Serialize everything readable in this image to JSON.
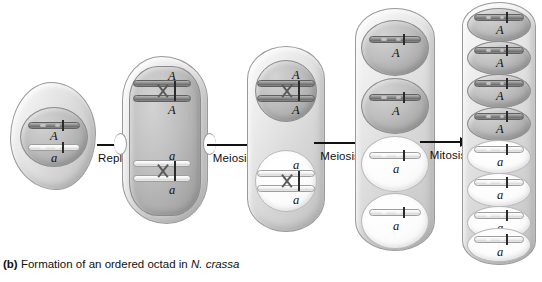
{
  "figure": {
    "caption_tag": "(b)",
    "caption_text": "Formation of an ordered octad in",
    "caption_species": "N. crassa",
    "background_color": "#ffffff",
    "allele_dominant": "A",
    "allele_recessive": "a"
  },
  "arrows": [
    {
      "label": "Replication"
    },
    {
      "label": "Meiosis I"
    },
    {
      "label": "Meiosis II"
    },
    {
      "label": "Mitosis"
    }
  ],
  "stages": [
    {
      "name": "parent-cell",
      "nuclei": [
        {
          "shade": "dark",
          "chromosomes": [
            {
              "allele": "A",
              "shade": "dark"
            },
            {
              "allele": "a",
              "shade": "light"
            }
          ]
        }
      ]
    },
    {
      "name": "replicated-cell",
      "nuclei": [
        {
          "shade": "dark",
          "chromosomes": [
            {
              "allele_top": "A",
              "allele_bottom": "A",
              "shade": "dark",
              "replicated": true
            },
            {
              "allele_top": "a",
              "allele_bottom": "a",
              "shade": "light",
              "replicated": true
            }
          ]
        }
      ]
    },
    {
      "name": "meiosis-one-cell",
      "nuclei": [
        {
          "shade": "dark",
          "allele_top": "A",
          "allele_bottom": "A"
        },
        {
          "shade": "light",
          "allele_top": "a",
          "allele_bottom": "a"
        }
      ]
    },
    {
      "name": "meiosis-two-cell",
      "nuclei": [
        {
          "shade": "dark",
          "allele": "A"
        },
        {
          "shade": "dark",
          "allele": "A"
        },
        {
          "shade": "light",
          "allele": "a"
        },
        {
          "shade": "light",
          "allele": "a"
        }
      ]
    },
    {
      "name": "octad-cell",
      "nuclei": [
        {
          "shade": "dark",
          "allele": "A"
        },
        {
          "shade": "dark",
          "allele": "A"
        },
        {
          "shade": "dark",
          "allele": "A"
        },
        {
          "shade": "dark",
          "allele": "A"
        },
        {
          "shade": "light",
          "allele": "a"
        },
        {
          "shade": "light",
          "allele": "a"
        },
        {
          "shade": "light",
          "allele": "a"
        },
        {
          "shade": "light",
          "allele": "a"
        }
      ]
    }
  ],
  "colors": {
    "cell_outline": "#9a9a9a",
    "nucleus_dark": "#a6a6a6",
    "nucleus_light": "#fcfcfc",
    "chromosome_dark": "#6f6f6f",
    "chromosome_light": "#d9d9d9",
    "text": "#111111"
  }
}
